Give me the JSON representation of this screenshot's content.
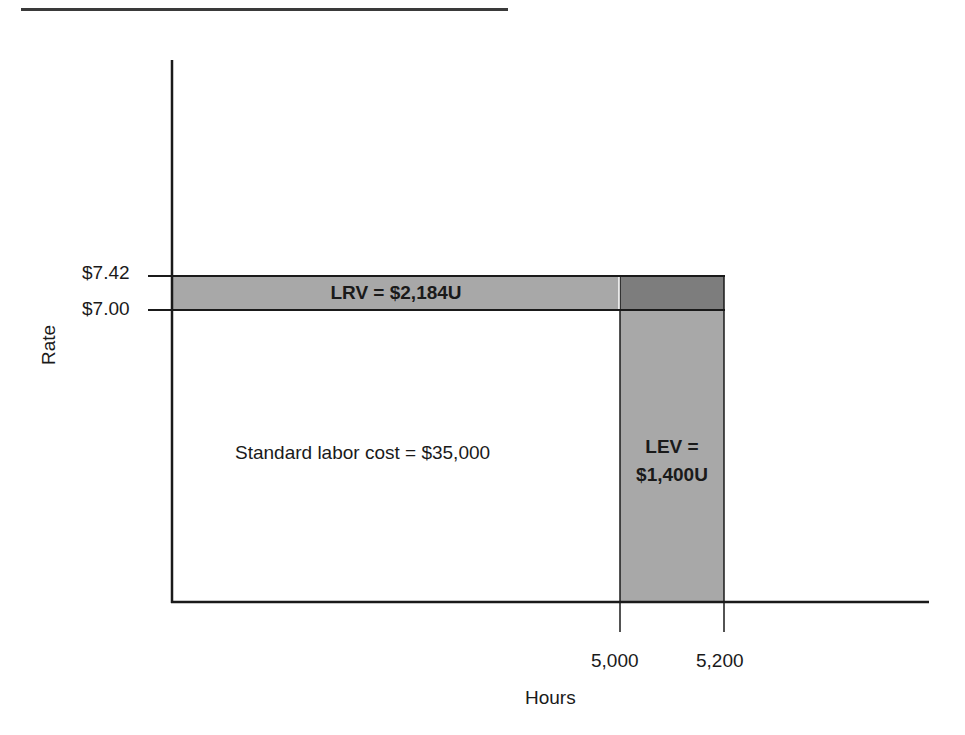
{
  "diagram": {
    "title": "",
    "y_axis": {
      "label": "Rate",
      "ticks": [
        {
          "label": "$7.42",
          "value": 7.42
        },
        {
          "label": "$7.00",
          "value": 7.0
        }
      ]
    },
    "x_axis": {
      "label": "Hours",
      "ticks": [
        {
          "label": "5,000",
          "value": 5000
        },
        {
          "label": "5,200",
          "value": 5200
        }
      ]
    },
    "regions": {
      "standard": {
        "label": "Standard labor cost = $35,000"
      },
      "lrv": {
        "label": "LRV = $2,184U"
      },
      "lev": {
        "label_line1": "LEV =",
        "label_line2": "$1,400U"
      }
    },
    "colors": {
      "band_fill": "#a8a8a8",
      "corner_fill": "#7d7d7d",
      "axis": "#1a1a1a",
      "header_rule": "#3a3a3a"
    }
  }
}
